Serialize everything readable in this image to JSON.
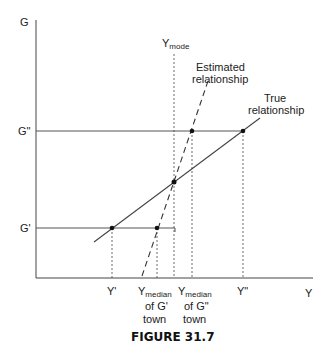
{
  "figure": {
    "caption": "FIGURE 31.7",
    "axes": {
      "y_label": "G",
      "x_label": "Y"
    },
    "y_ticks": [
      {
        "id": "g_double_prime",
        "label": "G\""
      },
      {
        "id": "g_prime",
        "label": "G'"
      }
    ],
    "x_ticks": [
      {
        "id": "y_prime",
        "label": "Y'"
      },
      {
        "id": "y_median_g_prime",
        "main": "Y",
        "sub": "median",
        "line2": "of G'",
        "line3": "town"
      },
      {
        "id": "y_median_g_double_prime",
        "main": "Y",
        "sub": "median",
        "line2": "of G\"",
        "line3": "town"
      },
      {
        "id": "y_double_prime",
        "label": "Y\""
      }
    ],
    "mode_label": {
      "main": "Y",
      "sub": "mode"
    },
    "curves": {
      "estimated": {
        "line1": "Estimated",
        "line2": "relationship",
        "style": "dashed"
      },
      "true": {
        "line1": "True",
        "line2": "relationship",
        "style": "solid"
      }
    },
    "colors": {
      "line": "#444444",
      "text": "#222222",
      "background": "#ffffff"
    }
  }
}
